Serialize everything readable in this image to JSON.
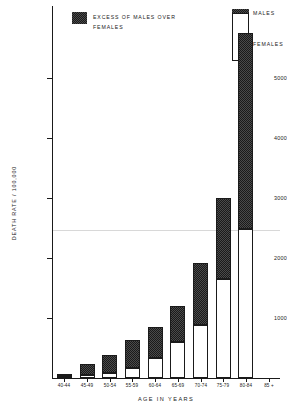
{
  "chart_data": {
    "type": "bar",
    "title": "",
    "subtitle": "",
    "xlabel": "AGE IN YEARS",
    "ylabel": "DEATH RATE / 100,000",
    "stacked": true,
    "grid": true,
    "legend_position": "top-left and right",
    "ylim": [
      0,
      5800
    ],
    "yticks": [
      1000,
      2000,
      3000,
      4000,
      5000
    ],
    "ytick_labels": [
      "1000",
      "2000",
      "3000",
      "4000",
      "5000"
    ],
    "categories": [
      "40-44",
      "45-49",
      "50-54",
      "55-59",
      "60-64",
      "65-69",
      "70-74",
      "75-79",
      "80-84",
      "85 +"
    ],
    "series": [
      {
        "name": "FEMALES",
        "values": [
          30,
          50,
          80,
          170,
          330,
          600,
          880,
          1650,
          2480,
          0
        ]
      },
      {
        "name": "EXCESS OF MALES OVER FEMALES",
        "values": [
          40,
          180,
          300,
          460,
          520,
          600,
          1040,
          1350,
          3270,
          0
        ]
      }
    ],
    "totals": [
      70,
      230,
      380,
      630,
      850,
      1200,
      1920,
      3000,
      5750,
      0
    ],
    "annotations": [
      "Bar for 85 + age group not plotted in data area"
    ]
  },
  "legend": {
    "main_label_line1": "EXCESS OF MALES OVER",
    "main_label_line2": "FEMALES",
    "males_label": "MALES",
    "females_label": "FEMALES"
  },
  "axes": {
    "y_title": "DEATH RATE / 100,000",
    "x_title": "AGE IN YEARS",
    "y_tick_labels": [
      "5000",
      "4000",
      "3000",
      "2000",
      "1000"
    ],
    "x_tick_labels": [
      "40-44",
      "45-49",
      "50-54",
      "55-59",
      "60-64",
      "65-69",
      "70-74",
      "75-79",
      "80-84",
      "85 +"
    ]
  },
  "colors": {
    "axis": "#1a1a1a",
    "excess_fill": "#3a3a3a",
    "females_fill": "#ffffff",
    "gridline": "#d8d8d8"
  }
}
